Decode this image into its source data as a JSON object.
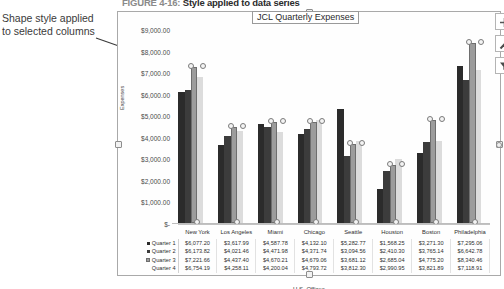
{
  "figure": {
    "number": "FIGURE 4-16:",
    "caption": "Style applied to data series"
  },
  "annotation": {
    "line1": "Shape style applied",
    "line2": "to selected columns"
  },
  "chart_buttons": [
    {
      "name": "chart-elements-button",
      "icon": "plus-icon",
      "label": "+"
    },
    {
      "name": "chart-styles-button",
      "icon": "paintbrush-icon",
      "label": ""
    },
    {
      "name": "chart-filters-button",
      "icon": "funnel-icon",
      "label": ""
    }
  ],
  "chart_data": {
    "type": "bar",
    "title": "JCL Quarterly Expenses",
    "xlabel": "U.S. Offices",
    "ylabel": "Expenses",
    "ylim": [
      0,
      9000
    ],
    "ytick_labels": [
      "$9,000.00",
      "$8,000.00",
      "$7,000.00",
      "$6,000.00",
      "$5,000.00",
      "$4,000.00",
      "$3,000.00",
      "$2,000.00",
      "$1,000.00",
      "$-"
    ],
    "ytick_values": [
      9000,
      8000,
      7000,
      6000,
      5000,
      4000,
      3000,
      2000,
      1000,
      0
    ],
    "grid": false,
    "legend_position": "data-table",
    "categories": [
      "New York",
      "Los Angeles",
      "Miami",
      "Chicago",
      "Seattle",
      "Houston",
      "Boston",
      "Philadelphia"
    ],
    "series": [
      {
        "name": "Quarter 1",
        "values": [
          6077.2,
          3617.99,
          4587.78,
          4132.1,
          5282.77,
          1568.25,
          3271.3,
          7295.06
        ],
        "labels": [
          "$6,077.20",
          "$3,617.99",
          "$4,587.78",
          "$4,132.10",
          "$5,282.77",
          "$1,568.25",
          "$3,271.30",
          "$7,295.06"
        ],
        "color": "#2b2b2b",
        "visible": true
      },
      {
        "name": "Quarter 2",
        "values": [
          6173.82,
          4021.46,
          4471.98,
          4371.74,
          3094.56,
          2410.3,
          3765.14,
          6642.78
        ],
        "labels": [
          "$6,173.82",
          "$4,021.46",
          "$4,471.98",
          "$4,371.74",
          "$3,094.56",
          "$2,410.30",
          "$3,765.14",
          "$6,642.78"
        ],
        "color": "#3c3c3c",
        "visible": true
      },
      {
        "name": "Quarter 3",
        "values": [
          7221.66,
          4437.4,
          4670.21,
          4679.06,
          3681.12,
          2685.04,
          4775.2,
          8340.46
        ],
        "labels": [
          "$7,221.66",
          "$4,437.40",
          "$4,670.21",
          "$4,679.06",
          "$3,681.12",
          "$2,685.04",
          "$4,775.20",
          "$8,340.46"
        ],
        "color": "#9c9c9c",
        "selected": true,
        "visible": true
      },
      {
        "name": "Quarter 4",
        "values": [
          6754.19,
          4258.11,
          4200.04,
          4793.72,
          3812.3,
          2990.95,
          3821.89,
          7118.91
        ],
        "labels": [
          "$6,754.19",
          "$4,258.11",
          "$4,200.04",
          "$4,793.72",
          "$3,812.30",
          "$2,990.95",
          "$3,821.89",
          "$7,118.91"
        ],
        "color": "#dcdcdc",
        "visible": false
      }
    ]
  }
}
